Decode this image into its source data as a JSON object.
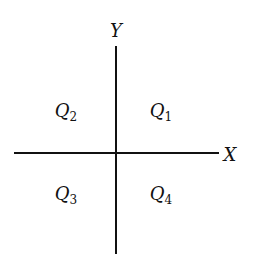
{
  "diagram": {
    "axes": {
      "x_label": "X",
      "y_label": "Y"
    },
    "quadrants": [
      {
        "id": "Q1",
        "letter": "Q",
        "sub": "1",
        "position": "upper-right"
      },
      {
        "id": "Q2",
        "letter": "Q",
        "sub": "2",
        "position": "upper-left"
      },
      {
        "id": "Q3",
        "letter": "Q",
        "sub": "3",
        "position": "lower-left"
      },
      {
        "id": "Q4",
        "letter": "Q",
        "sub": "4",
        "position": "lower-right"
      }
    ],
    "colors": {
      "line": "#111111",
      "background": "#ffffff"
    }
  }
}
